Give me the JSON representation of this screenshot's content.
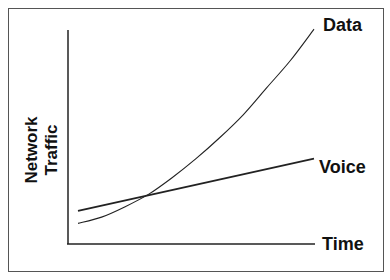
{
  "chart_data": {
    "type": "line",
    "title": "",
    "xlabel": "Time",
    "ylabel": "Network Traffic",
    "ylabel_lines": [
      "Network",
      "Traffic"
    ],
    "grid": false,
    "ticks": false,
    "x": [
      0,
      0.1,
      0.2,
      0.3,
      0.4,
      0.5,
      0.6,
      0.7,
      0.8,
      0.9,
      1.0
    ],
    "series": [
      {
        "name": "Data",
        "shape": "exponential",
        "values": [
          0.07,
          0.1,
          0.15,
          0.21,
          0.29,
          0.38,
          0.48,
          0.59,
          0.72,
          0.85,
          1.0
        ]
      },
      {
        "name": "Voice",
        "shape": "linear",
        "values": [
          0.13,
          0.155,
          0.18,
          0.205,
          0.23,
          0.255,
          0.28,
          0.305,
          0.33,
          0.355,
          0.38
        ]
      }
    ],
    "xlim": [
      0,
      1
    ],
    "ylim": [
      0,
      1.02
    ],
    "annotations": [
      "Data",
      "Voice",
      "Time"
    ]
  }
}
